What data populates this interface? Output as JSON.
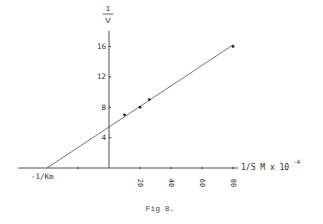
{
  "chart_data": {
    "type": "line",
    "title": "",
    "caption": "Fig 8.",
    "xlabel": "1/S M x 10^-4",
    "xlabel_parts": {
      "main": "1/S M x 10",
      "exp": "-4"
    },
    "ylabel": "1/V",
    "ylabel_parts": {
      "num": "1",
      "den": "V"
    },
    "x_ticks": [
      -20,
      20,
      40,
      60,
      80
    ],
    "x_tick_labels": [
      "20",
      "40",
      "60",
      "80"
    ],
    "y_ticks": [
      4,
      8,
      12,
      16
    ],
    "y_tick_labels": [
      "4",
      "8",
      "12",
      "16"
    ],
    "xlim": [
      -58,
      86
    ],
    "ylim": [
      0,
      18
    ],
    "grid": false,
    "legend": null,
    "annotations": [
      {
        "text": "-1/Km",
        "x": -40,
        "y": 0,
        "note": "x-intercept of extrapolated line"
      }
    ],
    "series": [
      {
        "name": "data points",
        "marker": "dot",
        "x": [
          10,
          20,
          26,
          80
        ],
        "y": [
          7,
          8,
          9,
          16
        ]
      },
      {
        "name": "fit line (Lineweaver-Burk)",
        "marker": "none",
        "x": [
          -40,
          80
        ],
        "y": [
          0,
          16.2
        ]
      }
    ]
  },
  "layout": {
    "origin_px": [
      109,
      168
    ],
    "px_per_x": 1.55,
    "px_per_y": 7.6,
    "x_axis_px": [
      18,
      238
    ],
    "y_axis_px": [
      31,
      168
    ]
  }
}
